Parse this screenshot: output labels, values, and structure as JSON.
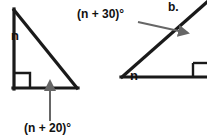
{
  "figure": {
    "part_label": "b.",
    "colors": {
      "stroke": "#1a1a1a",
      "arrow": "#666666",
      "background": "#ffffff",
      "text": "#111111"
    },
    "left_triangle": {
      "name": "right-triangle-left",
      "vertex_angle_label": "n",
      "base_angle_label": "(n + 20)°",
      "right_angle_marker": true,
      "points": "14,10 14,88 76,88"
    },
    "right_triangle": {
      "name": "right-triangle-right",
      "base_angle_label": "n",
      "exterior_angle_label": "(n + 30)°",
      "right_angle_marker": true,
      "base_start": "122,77",
      "base_end": "200,77",
      "diagonal_end": "203,5"
    },
    "annotations": [
      {
        "name": "arrow-to-base-angle",
        "from": "50,120",
        "to": "50,80",
        "target_label": "(n + 20)°"
      },
      {
        "name": "arrow-to-exterior-angle",
        "from": "140,23",
        "to": "190,34",
        "target_label": "(n + 30)°"
      }
    ]
  }
}
